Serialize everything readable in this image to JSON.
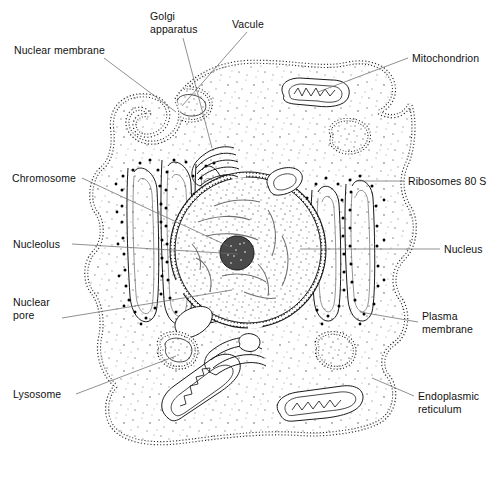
{
  "figure": {
    "style": "black-and-white line drawing with stippled cytoplasm",
    "width": 496,
    "height": 480,
    "colors": {
      "background": "#ffffff",
      "ink": "#1a1a1a",
      "leader_line": "#6b6b6b",
      "stipple": "#9a9a9a",
      "ribosome_dot": "#000000",
      "nucleolus": "#3a3a3a"
    }
  },
  "labels": [
    {
      "id": "nuclear-membrane",
      "text": "Nuclear membrane",
      "side": "left",
      "x": 14,
      "y": 44,
      "anchor_x": 104,
      "anchor_y": 58,
      "target_x": 176,
      "target_y": 112
    },
    {
      "id": "golgi-apparatus",
      "text": "Golgi\napparatus",
      "side": "top",
      "x": 150,
      "y": 10,
      "anchor_x": 183,
      "anchor_y": 38,
      "target_x": 212,
      "target_y": 148
    },
    {
      "id": "vacule",
      "text": "Vacule",
      "side": "top",
      "x": 232,
      "y": 18,
      "anchor_x": 247,
      "anchor_y": 32,
      "target_x": 182,
      "target_y": 106
    },
    {
      "id": "mitochondrion",
      "text": "Mitochondrion",
      "side": "right",
      "x": 412,
      "y": 52,
      "anchor_x": 408,
      "anchor_y": 58,
      "target_x": 318,
      "target_y": 92
    },
    {
      "id": "chromosome",
      "text": "Chromosome",
      "side": "left",
      "x": 12,
      "y": 172,
      "anchor_x": 82,
      "anchor_y": 178,
      "target_x": 228,
      "target_y": 246
    },
    {
      "id": "ribosomes-80s",
      "text": "Ribosomes 80 S",
      "side": "right",
      "x": 408,
      "y": 175,
      "anchor_x": 404,
      "anchor_y": 181,
      "target_x": 356,
      "target_y": 181
    },
    {
      "id": "nucleolus",
      "text": "Nucleolus",
      "side": "left",
      "x": 13,
      "y": 238,
      "anchor_x": 72,
      "anchor_y": 244,
      "target_x": 238,
      "target_y": 254
    },
    {
      "id": "nucleus",
      "text": "Nucleus",
      "side": "right",
      "x": 444,
      "y": 243,
      "anchor_x": 440,
      "anchor_y": 249,
      "target_x": 300,
      "target_y": 249
    },
    {
      "id": "nuclear-pore",
      "text": "Nuclear\npore",
      "side": "left",
      "x": 13,
      "y": 296,
      "anchor_x": 62,
      "anchor_y": 318,
      "target_x": 232,
      "target_y": 290
    },
    {
      "id": "plasma-membrane",
      "text": "Plasma\nmembrane",
      "side": "right",
      "x": 422,
      "y": 310,
      "anchor_x": 418,
      "anchor_y": 322,
      "target_x": 360,
      "target_y": 312
    },
    {
      "id": "lysosome",
      "text": "Lysosome",
      "side": "left",
      "x": 13,
      "y": 388,
      "anchor_x": 76,
      "anchor_y": 394,
      "target_x": 176,
      "target_y": 356
    },
    {
      "id": "endoplasmic-reticulum",
      "text": "Endoplasmic\nreticulum",
      "side": "right",
      "x": 418,
      "y": 390,
      "anchor_x": 414,
      "anchor_y": 396,
      "target_x": 372,
      "target_y": 378
    }
  ],
  "organelles": {
    "nucleus": {
      "name": "Nucleus",
      "center_x": 248,
      "center_y": 250,
      "radius": 78,
      "contains": [
        "nucleolus",
        "chromosome strands"
      ]
    },
    "nucleolus": {
      "name": "Nucleolus",
      "center_x": 237,
      "center_y": 253,
      "radius": 17
    },
    "mitochondria_count": 4,
    "golgi_stacks": 2,
    "vesicle_count": 5,
    "er_regions": 2
  }
}
